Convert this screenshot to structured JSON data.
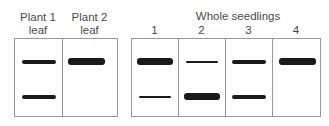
{
  "left_panel": {
    "lanes": [
      {
        "label_line1": "Plant 1",
        "label_line2": "leaf"
      },
      {
        "label_line1": "Plant 2",
        "label_line2": "leaf"
      }
    ]
  },
  "right_panel": {
    "title": "Whole seedlings",
    "lanes": [
      {
        "label": "1"
      },
      {
        "label": "2"
      },
      {
        "label": "3"
      },
      {
        "label": "4"
      }
    ]
  },
  "bands": {
    "plant1": [
      {
        "position": "upper",
        "intensity": "medium"
      },
      {
        "position": "lower",
        "intensity": "medium"
      }
    ],
    "plant2": [
      {
        "position": "upper",
        "intensity": "strong"
      }
    ],
    "seedling1": [
      {
        "position": "upper",
        "intensity": "strong"
      },
      {
        "position": "lower",
        "intensity": "weak"
      }
    ],
    "seedling2": [
      {
        "position": "upper",
        "intensity": "weak"
      },
      {
        "position": "lower",
        "intensity": "strong"
      }
    ],
    "seedling3": [
      {
        "position": "upper",
        "intensity": "medium"
      },
      {
        "position": "lower",
        "intensity": "medium"
      }
    ],
    "seedling4": [
      {
        "position": "upper",
        "intensity": "strong"
      }
    ]
  }
}
